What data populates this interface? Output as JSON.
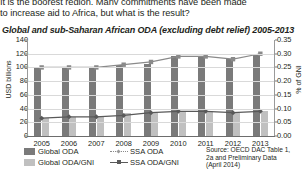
{
  "body_text": {
    "line1": "It is the poorest region. Many commitments have been made",
    "line2": "to increase aid to Africa, but what is the result?"
  },
  "figure": {
    "title": "Global and sub-Saharan African ODA (excluding debt relief) 2005-2013",
    "source": {
      "line1": "Source: OECD DAC Table 1,",
      "line2": "2a and Preliminary Data",
      "line3": "(April 2014)"
    },
    "legend": [
      {
        "label": "Global ODA",
        "type": "bar",
        "color": "#7a7a7a"
      },
      {
        "label": "Global ODA/GNI",
        "type": "bar",
        "color": "#c0c0c0"
      },
      {
        "label": "SSA ODA",
        "type": "dotted-line",
        "color": "#8a8a8a"
      },
      {
        "label": "SSA ODA/GNI",
        "type": "line-marker",
        "color": "#595959"
      }
    ]
  },
  "chart_data": {
    "type": "bar",
    "title": "Global and sub-Saharan African ODA (excluding debt relief) 2005-2013",
    "xlabel": "",
    "ylabel": "USD billions",
    "y2label": "% of GNI",
    "ylim": [
      0,
      140
    ],
    "y2lim": [
      0.0,
      0.35
    ],
    "yticks": [
      "0",
      "20",
      "40",
      "60",
      "80",
      "100",
      "120",
      "140"
    ],
    "y2ticks": [
      "0.00",
      "0.05",
      "0.10",
      "0.15",
      "0.20",
      "0.25",
      "0.30",
      "0.35"
    ],
    "grid": true,
    "legend_position": "bottom-left",
    "categories": [
      "2005",
      "2006",
      "2007",
      "2008",
      "2009",
      "2010",
      "2011",
      "2012",
      "2013"
    ],
    "series": [
      {
        "name": "Global ODA",
        "kind": "bar",
        "axis": "left",
        "unit": "USD billions",
        "color": "#7a7a7a",
        "values": [
          100,
          99,
          99,
          103,
          105,
          117,
          116,
          113,
          120
        ]
      },
      {
        "name": "SSA ODA",
        "kind": "bar",
        "axis": "left",
        "unit": "USD billions",
        "color": "#c0c0c0",
        "values": [
          26,
          28,
          29,
          33,
          34,
          37,
          36,
          34,
          36
        ]
      },
      {
        "name": "Global ODA/GNI",
        "kind": "dotted-line",
        "axis": "right",
        "unit": "% of GNI",
        "color": "#8a8a8a",
        "values": [
          0.25,
          0.25,
          0.25,
          0.26,
          0.27,
          0.29,
          0.29,
          0.28,
          0.3
        ]
      },
      {
        "name": "SSA ODA/GNI",
        "kind": "line-marker",
        "axis": "right",
        "unit": "% of GNI",
        "color": "#595959",
        "values": [
          0.065,
          0.07,
          0.07,
          0.075,
          0.085,
          0.09,
          0.09,
          0.085,
          0.09
        ]
      }
    ]
  }
}
